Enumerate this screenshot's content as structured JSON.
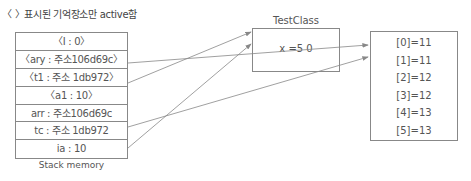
{
  "note": "〈 〉표시된 기억장소만 active함",
  "stack": {
    "label": "Stack memory",
    "rows": [
      {
        "text": "〈I : 0〉"
      },
      {
        "text": "〈ary : 주소106d69c〉"
      },
      {
        "text": "〈t1 : 주소 1db972〉"
      },
      {
        "text": "〈a1 : 10〉"
      },
      {
        "text": "arr : 주소106d69c"
      },
      {
        "text": "tc : 주소 1db972"
      },
      {
        "text": "ia : 10"
      }
    ]
  },
  "test_class": {
    "title": "TestClass",
    "field": "x =5 0"
  },
  "array": {
    "cells": [
      {
        "text": "[0]=11"
      },
      {
        "text": "[1]=11"
      },
      {
        "text": "[2]=12"
      },
      {
        "text": "[3]=12"
      },
      {
        "text": "[4]=13"
      },
      {
        "text": "[5]=13"
      }
    ]
  },
  "colors": {
    "line": "#888888",
    "text": "#555555"
  }
}
